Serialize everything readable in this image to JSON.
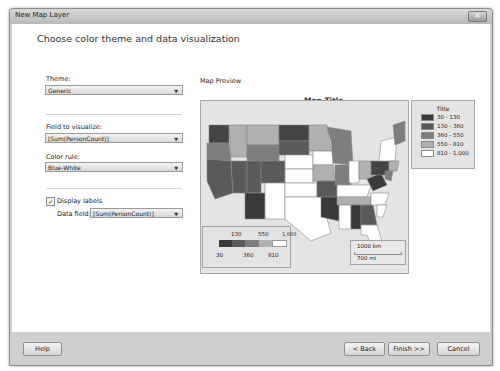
{
  "window": {
    "title": "New Map Layer",
    "close_icon": "close-icon"
  },
  "page": {
    "heading": "Choose color theme and data visualization"
  },
  "form": {
    "theme_label": "Theme:",
    "theme_value": "Generic",
    "field_label": "Field to visualize:",
    "field_value": "[Sum(PersonCount)]",
    "color_rule_label": "Color rule:",
    "color_rule_value": "Blue-White",
    "display_labels_label": "Display labels",
    "display_labels_checked": true,
    "check_glyph": "✓",
    "data_field_label": "Data field:",
    "data_field_value": "[Sum(PersonCount)]",
    "arrow_glyph": "▼"
  },
  "preview": {
    "section_label": "Map Preview",
    "map_title": "Map Title",
    "legend": {
      "title": "Title",
      "items": [
        {
          "label": "30 - 130",
          "color": "#3a3a3a"
        },
        {
          "label": "130 - 360",
          "color": "#5a5a5a"
        },
        {
          "label": "360 - 550",
          "color": "#7e7e7e"
        },
        {
          "label": "550 - 810",
          "color": "#b0b0b0"
        },
        {
          "label": "810 - 1,000",
          "color": "#ffffff"
        }
      ]
    },
    "color_scale": {
      "top_ticks": [
        "130",
        "550",
        "1,000"
      ],
      "bottom_ticks": [
        "30",
        "360",
        "810"
      ],
      "colors": [
        "#3a3a3a",
        "#5a5a5a",
        "#7e7e7e",
        "#b0b0b0",
        "#ffffff"
      ]
    },
    "distance_scale": {
      "km": "1000 km",
      "mi": "700 mi"
    }
  },
  "footer": {
    "help": "Help",
    "back": "< Back",
    "finish": "Finish >>",
    "cancel": "Cancel"
  }
}
